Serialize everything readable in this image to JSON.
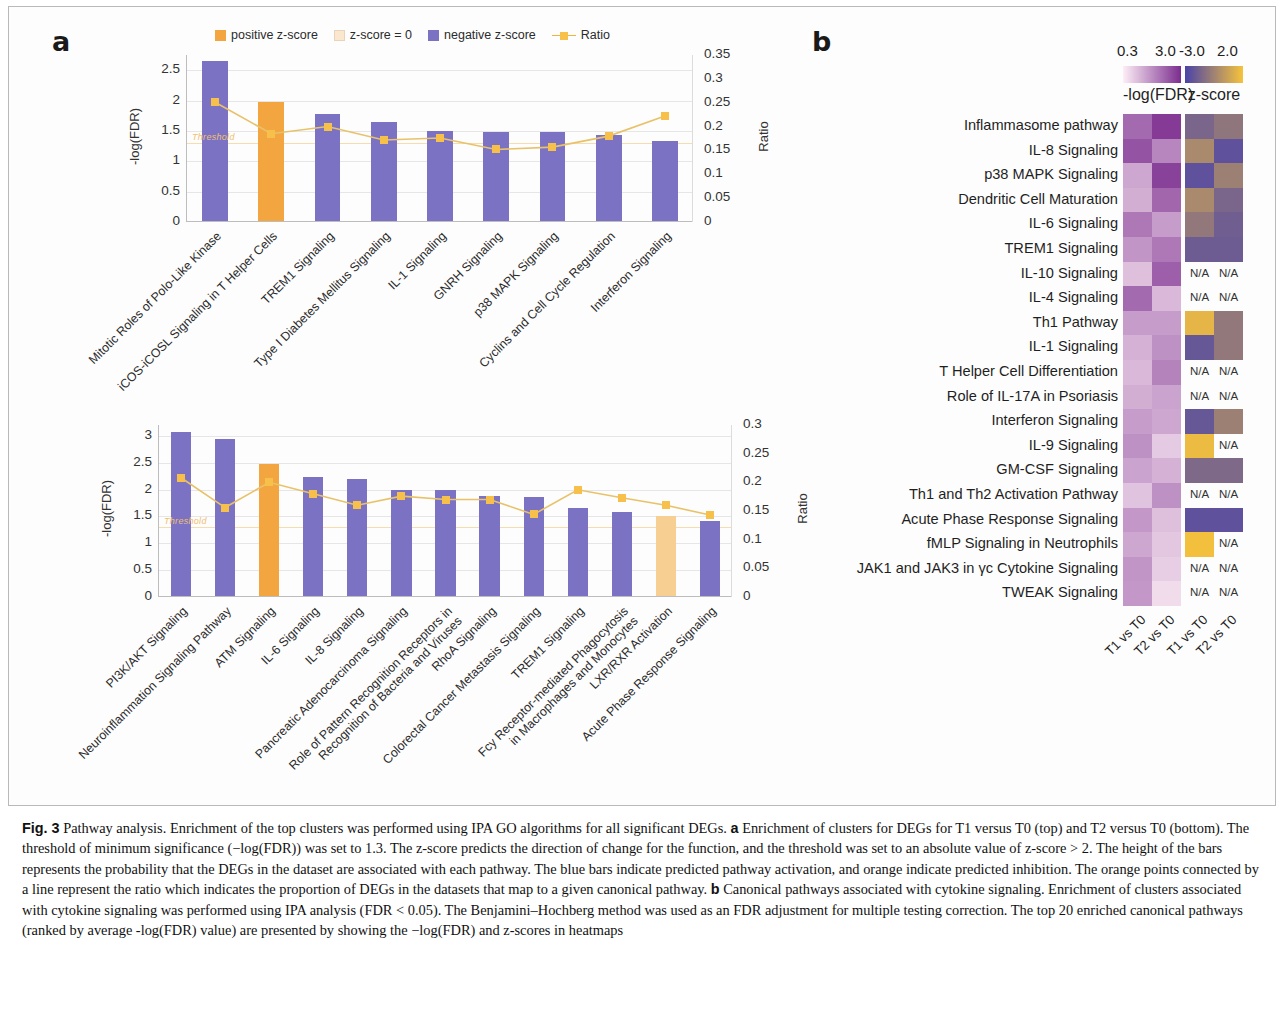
{
  "panels": {
    "a_letter": "a",
    "b_letter": "b"
  },
  "legend": {
    "items": [
      {
        "label": "positive z-score",
        "color": "#f3a63f",
        "type": "swatch"
      },
      {
        "label": "z-score = 0",
        "color": "#fbe7cd",
        "type": "swatch"
      },
      {
        "label": "negative z-score",
        "color": "#7b72c4",
        "type": "swatch"
      },
      {
        "label": "Ratio",
        "color": "#f7c04a",
        "type": "line"
      }
    ]
  },
  "chart_data": [
    {
      "type": "bar",
      "id": "top-chart",
      "title": "",
      "xlabel": "",
      "ylabel": "-log(FDR)",
      "y2label": "Ratio",
      "ylim": [
        0,
        2.75
      ],
      "y2lim": [
        0,
        0.35
      ],
      "yticks": [
        "0",
        "0.5",
        "1",
        "1.5",
        "2",
        "2.5"
      ],
      "y2ticks": [
        "0",
        "0.05",
        "0.1",
        "0.15",
        "0.2",
        "0.25",
        "0.3",
        "0.35"
      ],
      "threshold": 1.3,
      "threshold_label": "Threshold",
      "grid": true,
      "categories": [
        "Mitotic Roles of Polo-Like Kinase",
        "iCOS-iCOSL Signaling in T Helper Cells",
        "TREM1 Signaling",
        "Type I Diabetes Mellitus Signaling",
        "IL-1 Signaling",
        "GNRH Signaling",
        "p38 MAPK Signaling",
        "Cyclins and Cell Cycle Regulation",
        "Interferon Signaling"
      ],
      "values": [
        2.63,
        1.96,
        1.77,
        1.63,
        1.48,
        1.47,
        1.46,
        1.41,
        1.31
      ],
      "bar_colors": [
        "#7b72c4",
        "#f3a63f",
        "#7b72c4",
        "#7b72c4",
        "#7b72c4",
        "#7b72c4",
        "#7b72c4",
        "#7b72c4",
        "#7b72c4"
      ],
      "series": [
        {
          "name": "Ratio",
          "values": [
            0.251,
            0.185,
            0.2,
            0.172,
            0.176,
            0.152,
            0.157,
            0.18,
            0.222
          ]
        }
      ]
    },
    {
      "type": "bar",
      "id": "bottom-chart",
      "title": "",
      "xlabel": "",
      "ylabel": "-log(FDR)",
      "y2label": "Ratio",
      "ylim": [
        0,
        3.2
      ],
      "y2lim": [
        0,
        0.3
      ],
      "yticks": [
        "0",
        "0.5",
        "1",
        "1.5",
        "2",
        "2.5",
        "3"
      ],
      "y2ticks": [
        "0",
        "0.05",
        "0.1",
        "0.15",
        "0.2",
        "0.25",
        "0.3"
      ],
      "threshold": 1.3,
      "threshold_label": "Threshold",
      "grid": true,
      "categories": [
        "PI3K/AKT Signaling",
        "Neuroinflammation Signaling Pathway",
        "ATM Signaling",
        "IL-6 Signaling",
        "IL-8 Signaling",
        "Pancreatic Adenocarcinoma Signaling",
        "Role of Pattern Recognition Receptors in|Recognition of Bacteria and Viruses",
        "RhoA Signaling",
        "Colorectal Cancer Metastasis Signaling",
        "TREM1 Signaling",
        "Fcy Receptor-mediated Phagocytosis|in Macrophages and Monocytes",
        "LXR/RXR Activation",
        "Acute Phase Response Signaling"
      ],
      "values": [
        3.06,
        2.93,
        2.46,
        2.22,
        2.17,
        1.97,
        1.97,
        1.87,
        1.85,
        1.63,
        1.57,
        1.48,
        1.39
      ],
      "bar_colors": [
        "#7b72c4",
        "#7b72c4",
        "#f3a63f",
        "#7b72c4",
        "#7b72c4",
        "#7b72c4",
        "#7b72c4",
        "#7b72c4",
        "#7b72c4",
        "#7b72c4",
        "#7b72c4",
        "#f8cf93",
        "#7b72c4"
      ],
      "series": [
        {
          "name": "Ratio",
          "values": [
            0.208,
            0.156,
            0.2,
            0.18,
            0.16,
            0.176,
            0.17,
            0.17,
            0.144,
            0.187,
            0.173,
            0.16,
            0.143
          ]
        }
      ]
    },
    {
      "type": "heatmap",
      "id": "fdr-heatmap",
      "title": "-log(FDR)",
      "scale_min": "0.3",
      "scale_max": "3.0",
      "colormap_low": "#fdeef6",
      "colormap_high": "#7b2d8e",
      "columns": [
        "T1 vs T0",
        "T2 vs T0"
      ],
      "rows": [
        "Inflammasome pathway",
        "IL-8 Signaling",
        "p38 MAPK Signaling",
        "Dendritic Cell Maturation",
        "IL-6 Signaling",
        "TREM1 Signaling",
        "IL-10 Signaling",
        "IL-4 Signaling",
        "Th1 Pathway",
        "IL-1 Signaling",
        "T Helper Cell Differentiation",
        "Role of IL-17A in Psoriasis",
        "Interferon Signaling",
        "IL-9 Signaling",
        "GM-CSF Signaling",
        "Th1 and Th2 Activation Pathway",
        "Acute Phase Response Signaling",
        "fMLP Signaling in Neutrophils",
        "JAK1 and JAK3 in γc Cytokine Signaling",
        "TWEAK Signaling"
      ],
      "values": [
        [
          2.15,
          2.8
        ],
        [
          2.45,
          1.75
        ],
        [
          1.3,
          2.7
        ],
        [
          1.2,
          2.2
        ],
        [
          1.95,
          1.45
        ],
        [
          1.55,
          1.95
        ],
        [
          0.95,
          2.3
        ],
        [
          2.15,
          1.05
        ],
        [
          1.45,
          1.45
        ],
        [
          1.15,
          1.6
        ],
        [
          1.05,
          1.8
        ],
        [
          1.2,
          1.35
        ],
        [
          1.45,
          1.3
        ],
        [
          1.6,
          0.8
        ],
        [
          1.35,
          1.15
        ],
        [
          0.9,
          1.6
        ],
        [
          1.5,
          0.95
        ],
        [
          1.3,
          0.85
        ],
        [
          1.55,
          0.75
        ],
        [
          1.5,
          0.55
        ]
      ]
    },
    {
      "type": "heatmap",
      "id": "zscore-heatmap",
      "title": "z-score",
      "scale_min": "-3.0",
      "scale_max": "2.0",
      "colormap_low": "#4a42a8",
      "colormap_high": "#f6c33c",
      "na_label": "N/A",
      "columns": [
        "T1 vs T0",
        "T2 vs T0"
      ],
      "rows": [
        "Inflammasome pathway",
        "IL-8 Signaling",
        "p38 MAPK Signaling",
        "Dendritic Cell Maturation",
        "IL-6 Signaling",
        "TREM1 Signaling",
        "IL-10 Signaling",
        "IL-4 Signaling",
        "Th1 Pathway",
        "IL-1 Signaling",
        "T Helper Cell Differentiation",
        "Role of IL-17A in Psoriasis",
        "Interferon Signaling",
        "IL-9 Signaling",
        "GM-CSF Signaling",
        "Th1 and Th2 Activation Pathway",
        "Acute Phase Response Signaling",
        "fMLP Signaling in Neutrophils",
        "JAK1 and JAK3 in γc Cytokine Signaling",
        "TWEAK Signaling"
      ],
      "values": [
        [
          -1.6,
          -1.0
        ],
        [
          -0.2,
          -2.4
        ],
        [
          -2.4,
          -0.6
        ],
        [
          -0.2,
          -1.6
        ],
        [
          -0.9,
          -1.9
        ],
        [
          -2.0,
          -2.0
        ],
        [
          null,
          null
        ],
        [
          null,
          null
        ],
        [
          1.5,
          -0.9
        ],
        [
          -2.2,
          -0.9
        ],
        [
          null,
          null
        ],
        [
          null,
          null
        ],
        [
          -2.2,
          -0.6
        ],
        [
          1.7,
          null
        ],
        [
          -1.5,
          -1.5
        ],
        [
          null,
          null
        ],
        [
          -2.4,
          -2.4
        ],
        [
          1.9,
          null
        ],
        [
          null,
          null
        ],
        [
          null,
          null
        ]
      ]
    }
  ],
  "caption": {
    "prefix": "Fig. 3",
    "text_1": " Pathway analysis. Enrichment of the top clusters was performed using IPA GO algorithms for all significant DEGs. ",
    "bold_a": "a",
    "text_2": " Enrichment of clusters for DEGs for T1 versus T0 (top) and T2 versus T0 (bottom). The threshold of minimum significance (−log(FDR)) was set to 1.3. The z-score predicts the direction of change for the function, and the threshold was set to an absolute value of z-score > 2. The height of the bars represents the probability that the DEGs in the dataset are associated with each pathway. The blue bars indicate predicted pathway activation, and orange indicate predicted inhibition. The orange points connected by a line represent the ratio which indicates the proportion of DEGs in the datasets that map to a given canonical pathway. ",
    "bold_b": "b",
    "text_3": " Canonical pathways associated with cytokine signaling. Enrichment of clusters associated with cytokine signaling was performed using IPA analysis (FDR < 0.05). The Benjamini–Hochberg method was used as an FDR adjustment for multiple testing correction. The top 20 enriched canonical pathways (ranked by average -log(FDR) value) are presented by showing the −log(FDR) and z-scores in heatmaps"
  }
}
